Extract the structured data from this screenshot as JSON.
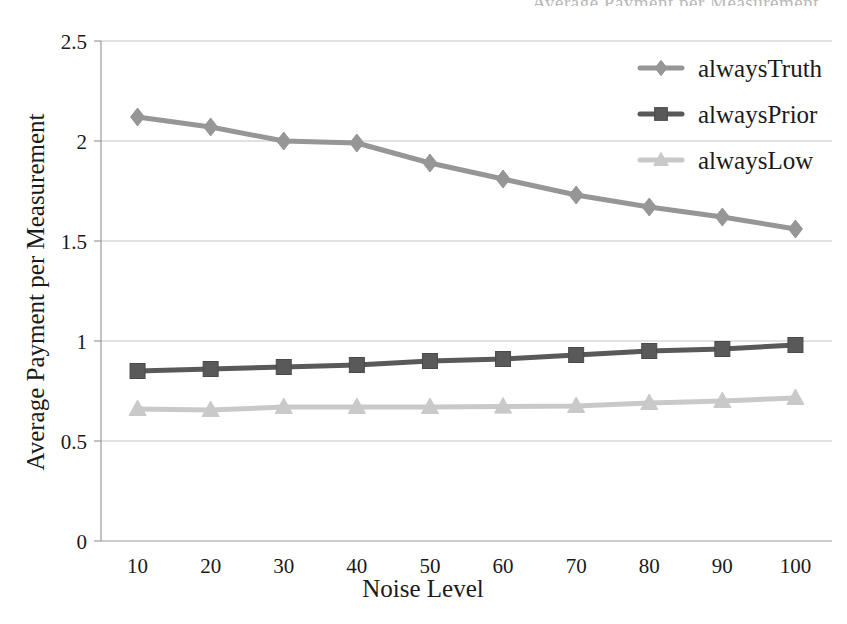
{
  "clipped_header": "Average Payment per Measurement",
  "chart_data": {
    "type": "line",
    "title": "",
    "xlabel": "Noise Level",
    "ylabel": "Average Payment per Measurement",
    "x": [
      10,
      20,
      30,
      40,
      50,
      60,
      70,
      80,
      90,
      100
    ],
    "categories": [
      "10",
      "20",
      "30",
      "40",
      "50",
      "60",
      "70",
      "80",
      "90",
      "100"
    ],
    "xtick_labels": [
      "10",
      "20",
      "30",
      "40",
      "50",
      "60",
      "70",
      "80",
      "90",
      "100"
    ],
    "ytick_labels": [
      "0",
      "0.5",
      "1",
      "1.5",
      "2",
      "2.5"
    ],
    "yticks": [
      0,
      0.5,
      1,
      1.5,
      2,
      2.5
    ],
    "ylim": [
      0,
      2.5
    ],
    "xlim": [
      10,
      100
    ],
    "grid": "horizontal",
    "legend_position": "top-right",
    "series": [
      {
        "name": "alwaysTruth",
        "marker": "diamond",
        "color": "#969696",
        "values": [
          2.12,
          2.07,
          2.0,
          1.99,
          1.89,
          1.81,
          1.73,
          1.67,
          1.62,
          1.56
        ]
      },
      {
        "name": "alwaysPrior",
        "marker": "square",
        "color": "#595959",
        "values": [
          0.85,
          0.86,
          0.87,
          0.88,
          0.9,
          0.91,
          0.93,
          0.95,
          0.96,
          0.98
        ]
      },
      {
        "name": "alwaysLow",
        "marker": "triangle",
        "color": "#c9c9c9",
        "values": [
          0.66,
          0.655,
          0.67,
          0.67,
          0.67,
          0.672,
          0.675,
          0.69,
          0.7,
          0.715
        ]
      }
    ]
  }
}
